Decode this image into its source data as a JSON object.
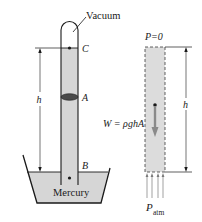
{
  "figure": {
    "colors": {
      "mercury_fill": "#d6d6d6",
      "stroke": "#1a1a1a",
      "ellipse": "#4a4a4a",
      "arrow_gray": "#8a8a8a",
      "dashed_fill": "#dcdcdc"
    }
  },
  "left_diagram": {
    "label_vacuum": "Vacuum",
    "label_C": "C",
    "label_A": "A",
    "label_B": "B",
    "label_h": "h",
    "label_mercury": "Mercury"
  },
  "right_diagram": {
    "label_p0": "P=0",
    "label_weight": "W = ρghA",
    "label_h": "h",
    "label_patm_main": "P",
    "label_patm_sub": "atm"
  }
}
